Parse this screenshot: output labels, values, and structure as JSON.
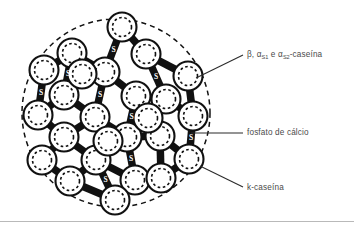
{
  "figure": {
    "type": "casein-micelle-diagram",
    "title_visible": false,
    "colors": {
      "ink": "#111111",
      "label_text": "#4a4a4a",
      "background": "#ffffff",
      "divider": "#b9b9b9"
    },
    "boundary": {
      "name": "micelle-outer-boundary",
      "shape": "circle",
      "style": "dashed",
      "cx": 116,
      "cy": 113,
      "r": 94
    },
    "submicelle": {
      "outer_radius": 14.5,
      "inner_radius": 9.5,
      "outer_style": "solid",
      "inner_style": "dashed",
      "count": 25
    },
    "submicelle_centers": [
      {
        "x": 122,
        "y": 27
      },
      {
        "x": 72,
        "y": 53
      },
      {
        "x": 146,
        "y": 54
      },
      {
        "x": 105,
        "y": 72
      },
      {
        "x": 188,
        "y": 76
      },
      {
        "x": 44,
        "y": 70
      },
      {
        "x": 64,
        "y": 95
      },
      {
        "x": 136,
        "y": 96
      },
      {
        "x": 166,
        "y": 99
      },
      {
        "x": 38,
        "y": 115
      },
      {
        "x": 95,
        "y": 117
      },
      {
        "x": 193,
        "y": 116
      },
      {
        "x": 64,
        "y": 137
      },
      {
        "x": 127,
        "y": 137
      },
      {
        "x": 160,
        "y": 136
      },
      {
        "x": 42,
        "y": 160
      },
      {
        "x": 96,
        "y": 160
      },
      {
        "x": 189,
        "y": 159
      },
      {
        "x": 70,
        "y": 181
      },
      {
        "x": 135,
        "y": 180
      },
      {
        "x": 161,
        "y": 178
      },
      {
        "x": 115,
        "y": 200
      },
      {
        "x": 82,
        "y": 74
      },
      {
        "x": 148,
        "y": 118
      },
      {
        "x": 108,
        "y": 141
      }
    ],
    "bridges": [
      {
        "x1": 122,
        "y1": 27,
        "x2": 146,
        "y2": 54,
        "label": ""
      },
      {
        "x1": 122,
        "y1": 27,
        "x2": 105,
        "y2": 72,
        "label": "S"
      },
      {
        "x1": 72,
        "y1": 53,
        "x2": 105,
        "y2": 72,
        "label": ""
      },
      {
        "x1": 72,
        "y1": 53,
        "x2": 44,
        "y2": 70,
        "label": ""
      },
      {
        "x1": 72,
        "y1": 53,
        "x2": 64,
        "y2": 95,
        "label": "S"
      },
      {
        "x1": 146,
        "y1": 54,
        "x2": 188,
        "y2": 76,
        "label": ""
      },
      {
        "x1": 146,
        "y1": 54,
        "x2": 166,
        "y2": 99,
        "label": "S"
      },
      {
        "x1": 105,
        "y1": 72,
        "x2": 136,
        "y2": 96,
        "label": ""
      },
      {
        "x1": 105,
        "y1": 72,
        "x2": 95,
        "y2": 117,
        "label": "S"
      },
      {
        "x1": 44,
        "y1": 70,
        "x2": 38,
        "y2": 115,
        "label": "S"
      },
      {
        "x1": 64,
        "y1": 95,
        "x2": 95,
        "y2": 117,
        "label": ""
      },
      {
        "x1": 64,
        "y1": 95,
        "x2": 38,
        "y2": 115,
        "label": ""
      },
      {
        "x1": 136,
        "y1": 96,
        "x2": 166,
        "y2": 99,
        "label": ""
      },
      {
        "x1": 136,
        "y1": 96,
        "x2": 127,
        "y2": 137,
        "label": "S"
      },
      {
        "x1": 166,
        "y1": 99,
        "x2": 193,
        "y2": 116,
        "label": ""
      },
      {
        "x1": 188,
        "y1": 76,
        "x2": 193,
        "y2": 116,
        "label": ""
      },
      {
        "x1": 38,
        "y1": 115,
        "x2": 64,
        "y2": 137,
        "label": ""
      },
      {
        "x1": 95,
        "y1": 117,
        "x2": 127,
        "y2": 137,
        "label": ""
      },
      {
        "x1": 95,
        "y1": 117,
        "x2": 64,
        "y2": 137,
        "label": ""
      },
      {
        "x1": 193,
        "y1": 116,
        "x2": 189,
        "y2": 159,
        "label": "S"
      },
      {
        "x1": 64,
        "y1": 137,
        "x2": 42,
        "y2": 160,
        "label": ""
      },
      {
        "x1": 64,
        "y1": 137,
        "x2": 96,
        "y2": 160,
        "label": ""
      },
      {
        "x1": 127,
        "y1": 137,
        "x2": 160,
        "y2": 136,
        "label": ""
      },
      {
        "x1": 127,
        "y1": 137,
        "x2": 96,
        "y2": 160,
        "label": ""
      },
      {
        "x1": 127,
        "y1": 137,
        "x2": 135,
        "y2": 180,
        "label": "S"
      },
      {
        "x1": 160,
        "y1": 136,
        "x2": 189,
        "y2": 159,
        "label": ""
      },
      {
        "x1": 160,
        "y1": 136,
        "x2": 161,
        "y2": 178,
        "label": ""
      },
      {
        "x1": 42,
        "y1": 160,
        "x2": 70,
        "y2": 181,
        "label": ""
      },
      {
        "x1": 96,
        "y1": 160,
        "x2": 70,
        "y2": 181,
        "label": ""
      },
      {
        "x1": 96,
        "y1": 160,
        "x2": 135,
        "y2": 180,
        "label": ""
      },
      {
        "x1": 96,
        "y1": 160,
        "x2": 115,
        "y2": 200,
        "label": "S"
      },
      {
        "x1": 135,
        "y1": 180,
        "x2": 115,
        "y2": 200,
        "label": ""
      },
      {
        "x1": 70,
        "y1": 181,
        "x2": 115,
        "y2": 200,
        "label": ""
      },
      {
        "x1": 161,
        "y1": 178,
        "x2": 189,
        "y2": 159,
        "label": ""
      }
    ],
    "leaders": [
      {
        "name": "leader-beta",
        "x1": 196,
        "y1": 78,
        "x2": 243,
        "y2": 55
      },
      {
        "name": "leader-fosfato",
        "x1": 191,
        "y1": 133,
        "x2": 243,
        "y2": 133
      },
      {
        "name": "leader-kcaseina",
        "x1": 200,
        "y1": 166,
        "x2": 243,
        "y2": 187
      }
    ]
  },
  "labels": {
    "beta": {
      "prefix": "β, α",
      "sub1": "S1",
      "middle": " e α",
      "sub2": "S2",
      "suffix": "-caseína",
      "full_text": "β, αS1 e αS2-caseína"
    },
    "fosfato": "fosfato de cálcio",
    "kcaseina": "k-caseína"
  }
}
